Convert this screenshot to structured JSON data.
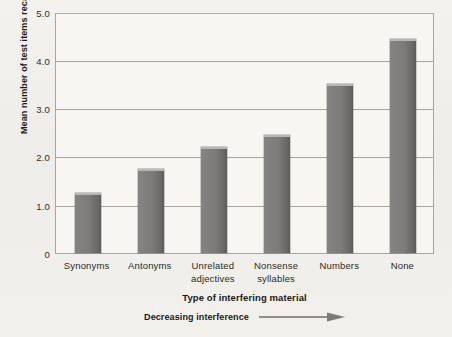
{
  "chart_data": {
    "type": "bar",
    "title": "",
    "categories": [
      "Synonyms",
      "Antonyms",
      "Unrelated adjectives",
      "Nonsense syllables",
      "Numbers",
      "None"
    ],
    "category_lines": [
      [
        "Synonyms"
      ],
      [
        "Antonyms"
      ],
      [
        "Unrelated",
        "adjectives"
      ],
      [
        "Nonsense",
        "syllables"
      ],
      [
        "Numbers"
      ],
      [
        "None"
      ]
    ],
    "values": [
      1.25,
      1.75,
      2.2,
      2.45,
      3.5,
      4.45
    ],
    "xlabel": "Type of interfering material",
    "ylabel": "Mean number of test items recalled",
    "ylim": [
      0,
      5
    ],
    "yticks": [
      0,
      1.0,
      2.0,
      3.0,
      4.0,
      5.0
    ],
    "ytick_labels": [
      "0",
      "1.0",
      "2.0",
      "3.0",
      "4.0",
      "5.0"
    ],
    "grid": true,
    "legend": "none",
    "annotation": "Decreasing interference",
    "annotation_icon": "right-arrow-icon",
    "bar_color": "#7b7a78",
    "bar_edge_color": "#5d5b59",
    "grid_color": "#a9a6a2",
    "plot_background": "#f7f6f3",
    "figure_background": "#f2f0ec"
  }
}
